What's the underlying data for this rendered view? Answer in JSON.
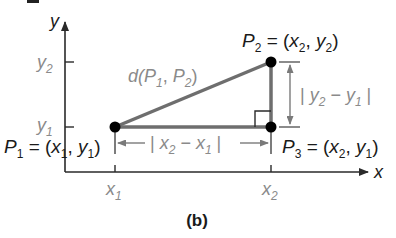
{
  "diagram": {
    "caption": "(b)",
    "axes": {
      "x_label": "x",
      "y_label": "y",
      "x_ticks": [
        {
          "main": "x",
          "sub": "1"
        },
        {
          "main": "x",
          "sub": "2"
        }
      ],
      "y_ticks": [
        {
          "main": "y",
          "sub": "1"
        },
        {
          "main": "y",
          "sub": "2"
        }
      ]
    },
    "points": {
      "p1": {
        "name": "P",
        "sub": "1",
        "eq": " = (",
        "a": "x",
        "a_sub": "1",
        "sep": ", ",
        "b": "y",
        "b_sub": "1",
        "close": ")"
      },
      "p2": {
        "name": "P",
        "sub": "2",
        "eq": " = (",
        "a": "x",
        "a_sub": "2",
        "sep": ", ",
        "b": "y",
        "b_sub": "2",
        "close": ")"
      },
      "p3": {
        "name": "P",
        "sub": "3",
        "eq": " = (",
        "a": "x",
        "a_sub": "2",
        "sep": ", ",
        "b": "y",
        "b_sub": "1",
        "close": ")"
      }
    },
    "distance_label": {
      "fn": "d(",
      "p": "P",
      "s1": "1",
      "sep": ", ",
      "p2": "P",
      "s2": "2",
      "close": ")"
    },
    "horizontal_measure": {
      "open": "| ",
      "a": "x",
      "a_sub": "2",
      "minus": " − ",
      "b": "x",
      "b_sub": "1",
      "close": " |"
    },
    "vertical_measure": {
      "open": "| ",
      "a": "y",
      "a_sub": "2",
      "minus": " − ",
      "b": "y",
      "b_sub": "1",
      "close": " |"
    },
    "colors": {
      "axis": "#3a3a3a",
      "segment": "#6e6e6e",
      "label_gray": "#8a8a8a",
      "label_dark": "#1a1a1a",
      "point": "#000000"
    }
  }
}
